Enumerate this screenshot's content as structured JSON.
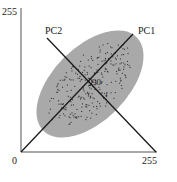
{
  "diagram": {
    "type": "pca-scatter-illustration",
    "axes": {
      "x_min_label": "0",
      "x_max_label": "255",
      "y_max_label": "255",
      "x_range": [
        0,
        255
      ],
      "y_range": [
        0,
        255
      ]
    },
    "principal_components": [
      {
        "name": "PC1",
        "label": "PC1",
        "direction_deg": 45
      },
      {
        "name": "PC2",
        "label": "PC2",
        "direction_deg": 135
      }
    ],
    "angle_label": "90",
    "ellipse": {
      "center": [
        128,
        128
      ],
      "orientation_deg": 45,
      "fill_color": "#a9a9a9",
      "dot_color": "#3a3a3a",
      "dot_count": 260
    },
    "colors": {
      "axis": "#555555",
      "pc_line": "#1a1a1a",
      "text": "#222222"
    },
    "caption": ""
  }
}
